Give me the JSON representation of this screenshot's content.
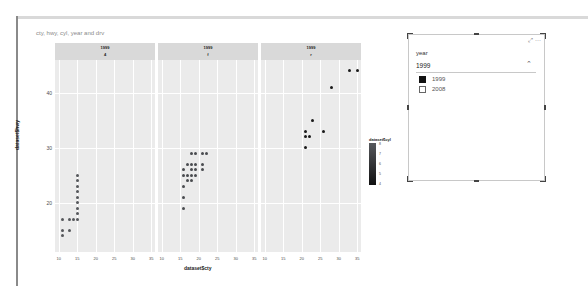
{
  "visual": {
    "title": "cty, hwy, cyl, year and drv"
  },
  "chart_data": {
    "type": "scatter",
    "title": "cty, hwy, cyl, year and drv",
    "xlabel": "dataset$cty",
    "ylabel": "dataset$hwy",
    "facets": [
      {
        "year": "1999",
        "drv": "4"
      },
      {
        "year": "1999",
        "drv": "f"
      },
      {
        "year": "1999",
        "drv": "r"
      }
    ],
    "xlim": [
      9,
      36
    ],
    "ylim": [
      11,
      46
    ],
    "x_ticks": [
      10,
      15,
      20,
      25,
      30,
      35
    ],
    "y_ticks": [
      20,
      30,
      40
    ],
    "grid": true,
    "color_legend": {
      "title": "dataset$cyl",
      "ticks": [
        "8",
        "7",
        "6",
        "5",
        "4"
      ],
      "low_color": "#111111",
      "high_color": "#56585c"
    },
    "series": [
      {
        "name": "4",
        "points": [
          [
            15,
            25
          ],
          [
            15,
            24
          ],
          [
            15,
            23
          ],
          [
            15,
            22
          ],
          [
            15,
            21
          ],
          [
            15,
            20
          ],
          [
            15,
            19
          ],
          [
            15,
            18
          ],
          [
            11,
            17
          ],
          [
            13,
            17
          ],
          [
            14,
            17
          ],
          [
            15,
            17
          ],
          [
            11,
            15
          ],
          [
            13,
            15
          ],
          [
            11,
            14
          ]
        ]
      },
      {
        "name": "f",
        "points": [
          [
            18,
            29
          ],
          [
            19,
            29
          ],
          [
            21,
            29
          ],
          [
            22,
            29
          ],
          [
            17,
            27
          ],
          [
            18,
            27
          ],
          [
            19,
            27
          ],
          [
            21,
            27
          ],
          [
            16,
            26
          ],
          [
            18,
            26
          ],
          [
            19,
            26
          ],
          [
            21,
            26
          ],
          [
            16,
            25
          ],
          [
            17,
            25
          ],
          [
            18,
            25
          ],
          [
            19,
            25
          ],
          [
            17,
            24
          ],
          [
            18,
            24
          ],
          [
            16,
            23
          ],
          [
            16,
            21
          ],
          [
            16,
            19
          ]
        ]
      },
      {
        "name": "r",
        "points": [
          [
            33,
            44
          ],
          [
            35,
            44
          ],
          [
            28,
            41
          ],
          [
            23,
            35
          ],
          [
            21,
            33
          ],
          [
            26,
            33
          ],
          [
            21,
            32
          ],
          [
            22,
            32
          ],
          [
            21,
            30
          ]
        ]
      }
    ]
  },
  "slicer": {
    "header": "year",
    "selected": "1999",
    "items": [
      {
        "label": "1999",
        "checked": true
      },
      {
        "label": "2008",
        "checked": false
      }
    ],
    "focus_icon": "⤢",
    "more_icon": "⋯",
    "chevron_icon": "⌃"
  }
}
